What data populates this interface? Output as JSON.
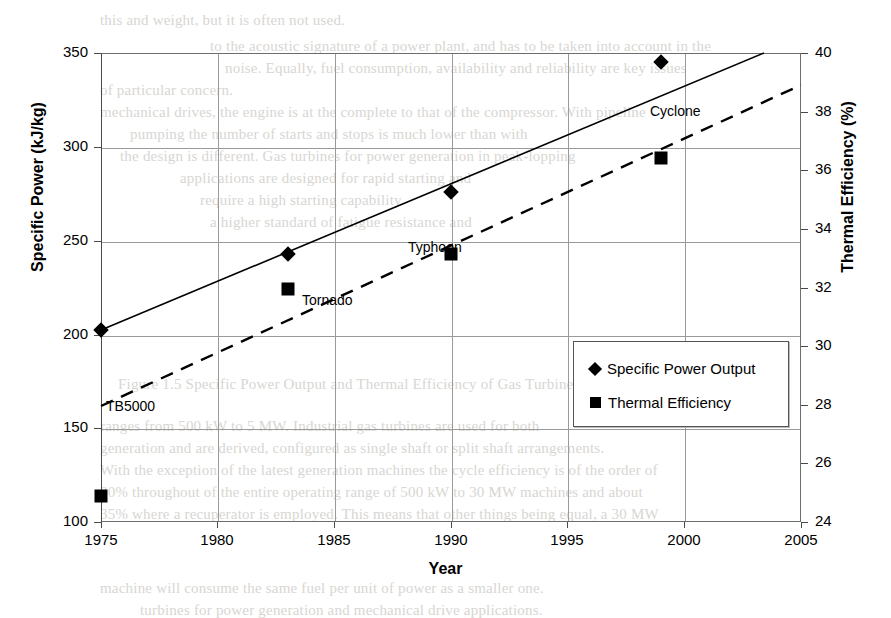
{
  "figure": {
    "xtitle": "Year",
    "ytitle_left": "Specific Power (kJ/kg)",
    "ytitle_right": "Thermal Efficiency (%)"
  },
  "legend": {
    "items": [
      {
        "label": "Specific Power Output",
        "marker": "diamond-marker"
      },
      {
        "label": "Thermal Efficiency",
        "marker": "square-marker"
      }
    ]
  },
  "chart_data": {
    "type": "scatter",
    "title": "",
    "xlabel": "Year",
    "ylabel": "Specific Power (kJ/kg)",
    "y2label": "Thermal Efficiency (%)",
    "xlim": [
      1975,
      2005
    ],
    "ylim": [
      100,
      350
    ],
    "y2lim": [
      24,
      40
    ],
    "xticks": [
      "1975",
      "1980",
      "1985",
      "1990",
      "1995",
      "2000",
      "2005"
    ],
    "yticks": [
      "100",
      "150",
      "200",
      "250",
      "300",
      "350"
    ],
    "y2ticks": [
      "24",
      "26",
      "28",
      "30",
      "32",
      "34",
      "36",
      "38",
      "40"
    ],
    "grid": true,
    "legend_position": "lower-right-inside",
    "annotations": [
      {
        "text": "TB5000",
        "x": 1975,
        "note": "labels 1975 engine pair"
      },
      {
        "text": "Tornado",
        "x": 1983,
        "note": "labels 1983 engine pair"
      },
      {
        "text": "Typhoon",
        "x": 1990,
        "note": "labels 1990 engine pair"
      },
      {
        "text": "Cyclone",
        "x": 1999,
        "note": "labels 1999 engine pair"
      }
    ],
    "series": [
      {
        "name": "Specific Power Output",
        "marker": "diamond",
        "axis": "left",
        "unit": "kJ/kg",
        "points": [
          {
            "x": 1975,
            "y": 186,
            "label": "TB5000"
          },
          {
            "x": 1983,
            "y": 227,
            "label": "Tornado"
          },
          {
            "x": 1990,
            "y": 260,
            "label": "Typhoon"
          },
          {
            "x": 1999,
            "y": 345,
            "label": "Cyclone"
          }
        ],
        "trendline": {
          "style": "solid",
          "x0": 1975,
          "y0": 180,
          "x1": 2003.4,
          "y1": 350
        }
      },
      {
        "name": "Thermal Efficiency",
        "marker": "square",
        "axis": "right",
        "unit": "%",
        "points": [
          {
            "x": 1975,
            "y": 23.9,
            "label": "TB5000"
          },
          {
            "x": 1983,
            "y": 30.9,
            "label": "Tornado"
          },
          {
            "x": 1990,
            "y": 32.1,
            "label": "Typhoon"
          },
          {
            "x": 1999,
            "y": 36.3,
            "label": "Cyclone"
          }
        ],
        "trendline": {
          "style": "dashed",
          "x0": 1975,
          "y0": 25.8,
          "x1": 2005,
          "y1": 38.9
        }
      }
    ]
  },
  "background_text": {
    "lines": [
      {
        "t": "this and weight, but it is often not used.",
        "x": 100,
        "y": 12
      },
      {
        "t": "to the acoustic signature of a power plant, and has to be taken into account in the",
        "x": 210,
        "y": 38
      },
      {
        "t": "noise. Equally, fuel consumption, availability and reliability are key issues",
        "x": 225,
        "y": 60
      },
      {
        "t": "of particular concern.",
        "x": 100,
        "y": 82
      },
      {
        "t": "mechanical drives, the engine is at the complete to that of the compressor. With pipeline",
        "x": 100,
        "y": 104
      },
      {
        "t": "pumping the number of starts and stops is much lower than with",
        "x": 130,
        "y": 126
      },
      {
        "t": "the design is different. Gas turbines for power generation in peak-lopping",
        "x": 120,
        "y": 148
      },
      {
        "t": "applications are designed for rapid starting and",
        "x": 180,
        "y": 170
      },
      {
        "t": "require a high starting capability.",
        "x": 200,
        "y": 192
      },
      {
        "t": "a higher standard of fatigue resistance and",
        "x": 210,
        "y": 214
      },
      {
        "t": "Figure 1.5  Specific Power Output and Thermal Efficiency of Gas Turbines",
        "x": 118,
        "y": 376
      },
      {
        "t": "ranges from 500 kW to 5 MW. Industrial gas turbines are used for both",
        "x": 100,
        "y": 418
      },
      {
        "t": "generation and are derived, configured as single shaft or split shaft arrangements.",
        "x": 100,
        "y": 440
      },
      {
        "t": "With the exception of the latest generation machines the cycle efficiency is of the order of",
        "x": 100,
        "y": 462
      },
      {
        "t": "30% throughout of the entire operating range of 500 kW to 30 MW machines and about",
        "x": 100,
        "y": 484
      },
      {
        "t": "35% where a recuperator is employed. This means that other things being equal, a 30 MW",
        "x": 100,
        "y": 506
      },
      {
        "t": "machine will consume the same fuel per unit of power as a smaller one.",
        "x": 100,
        "y": 580
      },
      {
        "t": "turbines for power generation and mechanical drive applications.",
        "x": 140,
        "y": 602
      }
    ]
  }
}
